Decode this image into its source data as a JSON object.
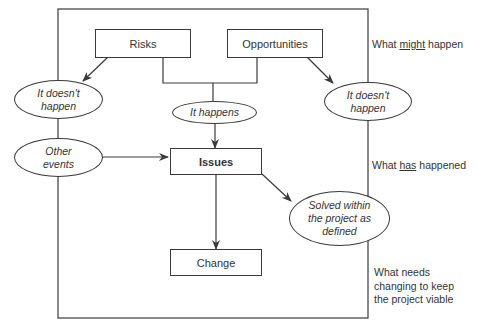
{
  "diagram": {
    "boxes": {
      "risks": "Risks",
      "opportunities": "Opportunities",
      "issues": "Issues",
      "change": "Change"
    },
    "ellipses": {
      "left_doesnt_happen_1": "It doesn't",
      "left_doesnt_happen_2": "happen",
      "it_happens": "It happens",
      "right_doesnt_happen_1": "It doesn't",
      "right_doesnt_happen_2": "happen",
      "other_events_1": "Other",
      "other_events_2": "events",
      "solved_1": "Solved within",
      "solved_2": "the project as",
      "solved_3": "defined"
    },
    "side_labels": {
      "might_pre": "What ",
      "might_u": "might",
      "might_post": " happen",
      "has_pre": "What ",
      "has_u": "has",
      "has_post": " happened",
      "needs_1": "What needs",
      "needs_2": "changing to keep",
      "needs_3": "the project viable"
    },
    "colors": {
      "line": "#3a3a3a",
      "text": "#333333",
      "background": "#ffffff"
    }
  }
}
